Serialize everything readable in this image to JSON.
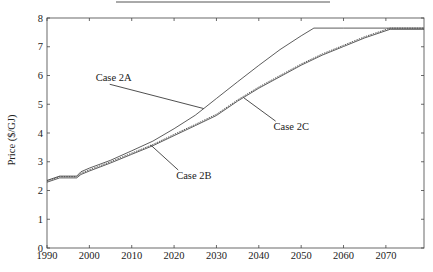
{
  "chart_data": {
    "type": "line",
    "title": "",
    "xlabel": "",
    "ylabel": "Price ($/GJ)",
    "xlim": [
      1990,
      2079
    ],
    "ylim": [
      0,
      8
    ],
    "grid": false,
    "legend": "none (inline annotations)",
    "x_ticks": [
      1990,
      2000,
      2010,
      2020,
      2030,
      2040,
      2050,
      2060,
      2070
    ],
    "y_ticks": [
      0,
      1,
      2,
      3,
      4,
      5,
      6,
      7,
      8
    ],
    "series": [
      {
        "name": "Case 2A",
        "style": "solid",
        "x": [
          1990,
          1993,
          1997,
          1998,
          2000,
          2005,
          2010,
          2015,
          2020,
          2025,
          2027,
          2030,
          2035,
          2040,
          2045,
          2050,
          2053,
          2060,
          2070,
          2079
        ],
        "values": [
          2.35,
          2.5,
          2.5,
          2.65,
          2.78,
          3.05,
          3.38,
          3.72,
          4.15,
          4.62,
          4.85,
          5.2,
          5.78,
          6.35,
          6.9,
          7.38,
          7.65,
          7.65,
          7.65,
          7.65
        ]
      },
      {
        "name": "Case 2B",
        "style": "solid",
        "x": [
          1990,
          1993,
          1997,
          1998,
          2000,
          2005,
          2010,
          2015,
          2020,
          2025,
          2030,
          2035,
          2040,
          2045,
          2050,
          2055,
          2060,
          2065,
          2071,
          2079
        ],
        "values": [
          2.33,
          2.48,
          2.48,
          2.6,
          2.72,
          3.0,
          3.3,
          3.6,
          3.95,
          4.3,
          4.65,
          5.15,
          5.6,
          6.0,
          6.4,
          6.75,
          7.05,
          7.35,
          7.65,
          7.65
        ]
      },
      {
        "name": "Case 2C",
        "style": "dashed",
        "x": [
          1990,
          1993,
          1997,
          1998,
          2000,
          2005,
          2010,
          2015,
          2020,
          2025,
          2030,
          2035,
          2040,
          2045,
          2050,
          2055,
          2060,
          2065,
          2071,
          2079
        ],
        "values": [
          2.33,
          2.48,
          2.48,
          2.6,
          2.72,
          3.0,
          3.3,
          3.6,
          3.95,
          4.3,
          4.65,
          5.15,
          5.6,
          6.0,
          6.4,
          6.75,
          7.05,
          7.35,
          7.65,
          7.65
        ]
      }
    ],
    "annotations": [
      {
        "text": "Case 2A",
        "label_x": 2001.5,
        "label_y": 5.8,
        "arrow_to_x": 2027,
        "arrow_to_y": 4.85
      },
      {
        "text": "Case 2B",
        "label_x": 2020.5,
        "label_y": 2.4,
        "arrow_to_x": 2014.5,
        "arrow_to_y": 3.58
      },
      {
        "text": "Case 2C",
        "label_x": 2043.5,
        "label_y": 4.1,
        "arrow_to_x": 2036.5,
        "arrow_to_y": 5.22
      }
    ]
  }
}
